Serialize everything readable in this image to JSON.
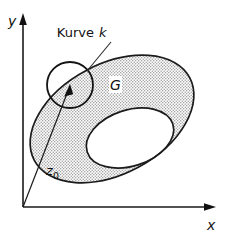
{
  "figure": {
    "background_color": "#ffffff",
    "ink_color": "#111111",
    "shading_color": "#c9c9c9",
    "shading_style": "stipple-dots"
  },
  "axes": {
    "x_label": "x",
    "y_label": "y",
    "origin": {
      "x": 23,
      "y": 207
    },
    "x_axis_end": {
      "x": 213,
      "y": 207
    },
    "y_axis_end": {
      "x": 23,
      "y": 17
    },
    "arrowheads": [
      "x-axis-right",
      "y-axis-up"
    ]
  },
  "labels": {
    "curve": "Kurve",
    "curve_name": "k",
    "region": "G",
    "point": "z",
    "point_subscript": "0"
  },
  "shapes": {
    "outer_region": {
      "name": "G",
      "kind": "ellipse-rotated",
      "cx": 112,
      "cy": 119,
      "rx": 88,
      "ry": 55,
      "rotation_deg": -28,
      "filled": true
    },
    "inner_hole": {
      "name": "hole",
      "kind": "ellipse-rotated",
      "cx": 130,
      "cy": 138,
      "rx": 45,
      "ry": 28,
      "rotation_deg": -18,
      "filled": false
    },
    "curve_k": {
      "name": "k",
      "kind": "circle",
      "cx": 70,
      "cy": 85,
      "r": 23,
      "filled": false
    },
    "point_z0": {
      "name": "z0",
      "x": 70,
      "y": 85
    },
    "leader_curve": {
      "from": {
        "x": 110,
        "y": 44
      },
      "to": {
        "x": 87,
        "y": 71
      }
    },
    "pointer_z0": {
      "from": {
        "x": 23,
        "y": 207
      },
      "to": {
        "x": 70,
        "y": 86
      }
    }
  }
}
